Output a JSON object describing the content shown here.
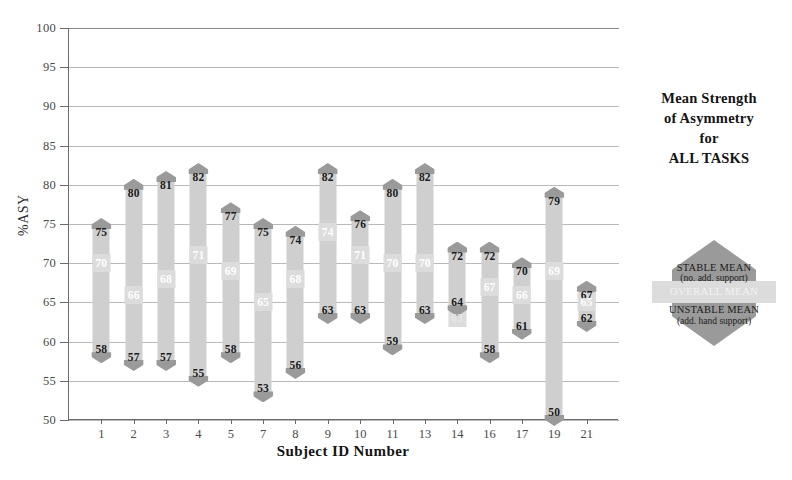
{
  "chart_data": {
    "type": "bar",
    "title": "Mean Strength of Asymmetry for ALL TASKS",
    "title_lines": [
      "Mean Strength",
      "of Asymmetry",
      "for",
      "ALL TASKS"
    ],
    "xlabel": "Subject ID Number",
    "ylabel": "%ASY",
    "ylim": [
      50,
      100
    ],
    "yticks": [
      50,
      55,
      60,
      65,
      70,
      75,
      80,
      85,
      90,
      95,
      100
    ],
    "grid": true,
    "legend_position": "right",
    "categories": [
      "1",
      "2",
      "3",
      "4",
      "5",
      "7",
      "8",
      "9",
      "10",
      "11",
      "13",
      "14",
      "16",
      "17",
      "19",
      "21"
    ],
    "series": [
      {
        "name": "STABLE MEAN",
        "values": [
          75,
          80,
          81,
          82,
          77,
          75,
          74,
          82,
          76,
          80,
          82,
          72,
          72,
          70,
          79,
          67
        ]
      },
      {
        "name": "OVERALL MEAN",
        "values": [
          70,
          66,
          68,
          71,
          69,
          65,
          68,
          74,
          71,
          70,
          70,
          63,
          67,
          66,
          69,
          65
        ]
      },
      {
        "name": "UNSTABLE MEAN",
        "values": [
          58,
          57,
          57,
          55,
          58,
          53,
          56,
          63,
          63,
          59,
          63,
          64,
          58,
          61,
          50,
          62
        ]
      }
    ],
    "colors": {
      "cap": "#9a9a9a",
      "band": "#cfcfcf",
      "overall_band": "#dcdcdc",
      "gridline": "#b9b9b9",
      "axis": "#6b6b6b",
      "text": "#1a1a1a"
    }
  },
  "legend": {
    "stable_label": "STABLE MEAN",
    "stable_sub": "(no. add. support)",
    "overall_label": "OVERALL MEAN",
    "unstable_label": "UNSTABLE MEAN",
    "unstable_sub": "(add. hand support)"
  }
}
